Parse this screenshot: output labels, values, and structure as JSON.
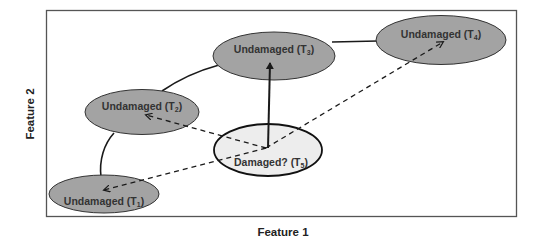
{
  "axes": {
    "x_label": "Feature 1",
    "y_label": "Feature 2"
  },
  "colors": {
    "undamaged_fill": "#a3a3a3",
    "damaged_fill": "#ededed",
    "stroke": "#1a1a1a",
    "frame": "#555555"
  },
  "nodes": [
    {
      "id": "T1",
      "label": "Undamaged (T",
      "sub": "1",
      "close": ")",
      "state": "undamaged"
    },
    {
      "id": "T2",
      "label": "Undamaged (T",
      "sub": "2",
      "close": ")",
      "state": "undamaged"
    },
    {
      "id": "T3",
      "label": "Undamaged (T",
      "sub": "3",
      "close": ")",
      "state": "undamaged"
    },
    {
      "id": "T4",
      "label": "Undamaged (T",
      "sub": "4",
      "close": ")",
      "state": "undamaged"
    },
    {
      "id": "T5",
      "label": "Damaged? (T",
      "sub": "5",
      "close": ")",
      "state": "unknown"
    }
  ],
  "edges": [
    {
      "from": "T1",
      "to": "T2",
      "style": "solid-curve"
    },
    {
      "from": "T2",
      "to": "T3",
      "style": "solid-curve"
    },
    {
      "from": "T3",
      "to": "T4",
      "style": "solid"
    },
    {
      "from": "T5",
      "to": "T3",
      "style": "solid-arrow"
    },
    {
      "from": "T5",
      "to": "T1",
      "style": "dashed-arrow"
    },
    {
      "from": "T5",
      "to": "T2",
      "style": "dashed-arrow"
    },
    {
      "from": "T5",
      "to": "T4",
      "style": "dashed-arrow"
    }
  ]
}
